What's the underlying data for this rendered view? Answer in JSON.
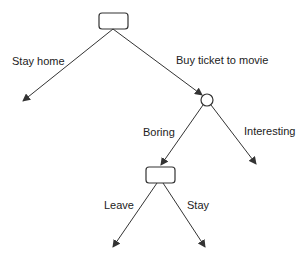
{
  "diagram": {
    "type": "decision-tree",
    "colors": {
      "stroke": "#333333",
      "text": "#222222",
      "background": "#ffffff"
    },
    "nodes": [
      {
        "id": "decision-root",
        "shape": "rounded-rect",
        "kind": "decision"
      },
      {
        "id": "chance-movie",
        "shape": "circle",
        "kind": "chance"
      },
      {
        "id": "decision-boring",
        "shape": "rounded-rect",
        "kind": "decision"
      }
    ],
    "edges": [
      {
        "from": "decision-root",
        "to": "outcome",
        "label": "Stay home"
      },
      {
        "from": "decision-root",
        "to": "chance-movie",
        "label": "Buy ticket to movie"
      },
      {
        "from": "chance-movie",
        "to": "decision-boring",
        "label": "Boring"
      },
      {
        "from": "chance-movie",
        "to": "outcome",
        "label": "Interesting"
      },
      {
        "from": "decision-boring",
        "to": "outcome",
        "label": "Leave"
      },
      {
        "from": "decision-boring",
        "to": "outcome",
        "label": "Stay"
      }
    ]
  }
}
